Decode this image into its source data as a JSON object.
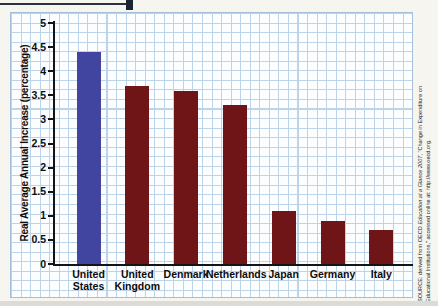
{
  "chart_data": {
    "type": "bar",
    "title": "",
    "xlabel": "",
    "ylabel": "Real Average Annual Increase (percentage)",
    "ylim": [
      0,
      5
    ],
    "ytick_labels": [
      "0",
      "0.5",
      "1",
      "1.5",
      "2",
      "2.5",
      "3",
      "3.5",
      "4",
      "4.5",
      "5"
    ],
    "categories": [
      "United\nStates",
      "United\nKingdom",
      "Denmark",
      "Netherlands",
      "Japan",
      "Germany",
      "Italy"
    ],
    "values": [
      4.4,
      3.7,
      3.6,
      3.3,
      1.1,
      0.9,
      0.7
    ],
    "bar_colors": [
      "#4145a0",
      "#6f1417",
      "#6f1417",
      "#6f1417",
      "#6f1417",
      "#6f1417",
      "#6f1417"
    ],
    "grid": true,
    "legend": false
  },
  "source_note": {
    "line1_prefix": "SOURCE: derived from OECD ",
    "line1_italic": "Education at a Glance 2007",
    "line1_suffix": ", “Change in Expenditure on",
    "line2": "Educational Institutions,” accessed online at: http://www.oecd.org."
  },
  "colors": {
    "highlight_bar": "#4145a0",
    "default_bar": "#6f1417",
    "grid_line": "#bdd3e7",
    "axis": "#141414"
  }
}
